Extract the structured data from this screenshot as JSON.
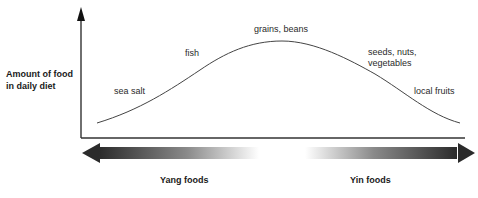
{
  "diagram": {
    "type": "curve",
    "y_axis_label_line1": "Amount of food",
    "y_axis_label_line2": "in daily diet",
    "curve_labels": {
      "sea_salt": "sea salt",
      "fish": "fish",
      "grains_beans": "grains, beans",
      "seeds_line1": "seeds, nuts,",
      "seeds_line2": "vegetables",
      "local_fruits": "local fruits"
    },
    "left_arrow_label": "Yang foods",
    "right_arrow_label": "Yin foods",
    "colors": {
      "line": "#333333",
      "arrow_dark": "#2b2b2b",
      "arrow_light": "#ffffff"
    }
  }
}
